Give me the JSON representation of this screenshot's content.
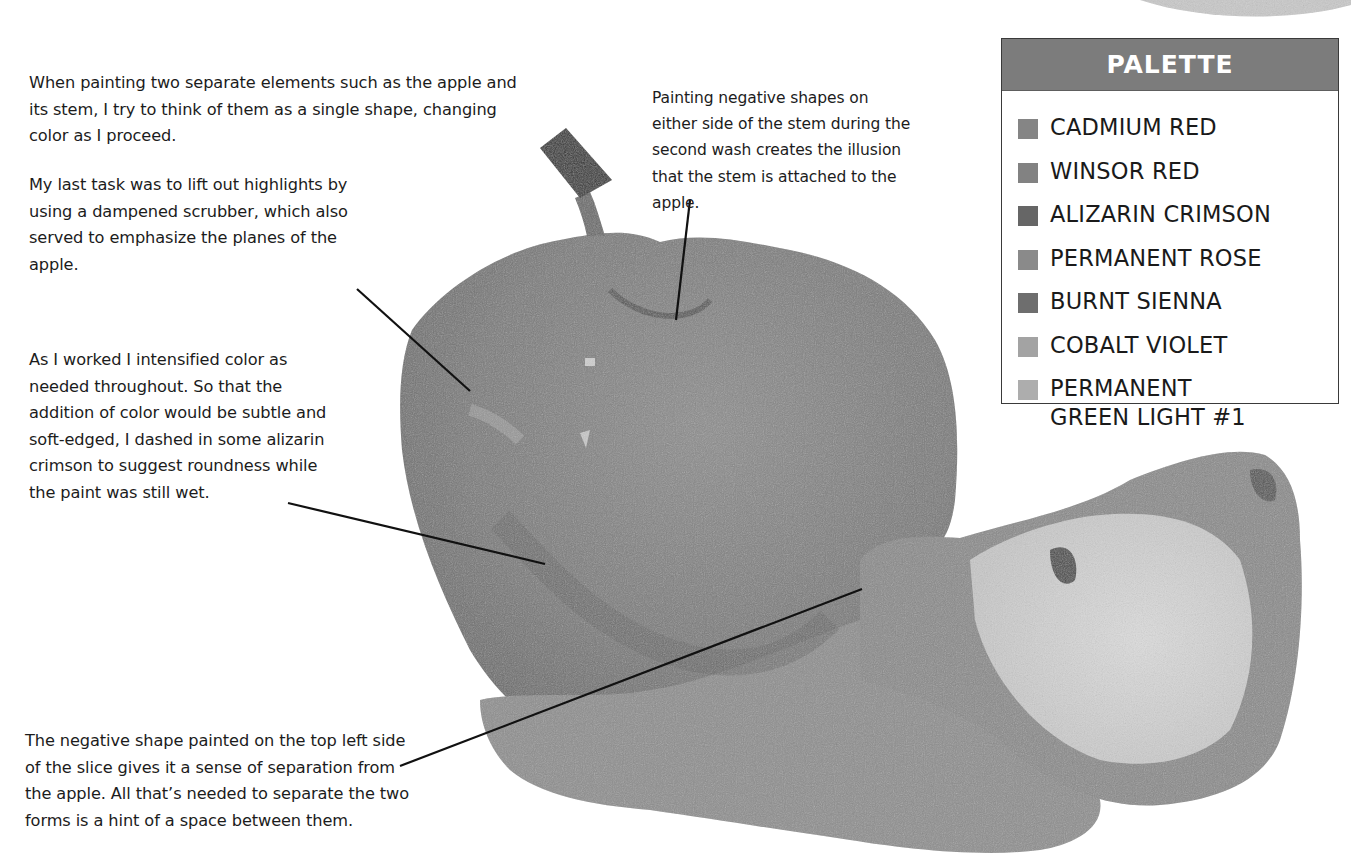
{
  "captions": {
    "stem_single_shape": "When painting two separate elements such as the apple and its stem, I try to think of them as a single shape, changing color as I proceed.",
    "lift_highlights": "My last task was to lift out highlights by using a dampened scrubber, which also served to emphasize the planes of the apple.",
    "intensify_color": "As I worked I intensified color as needed throughout. So that the addition of color would be subtle and soft-edged, I dashed in some alizarin crimson to suggest roundness while the paint was still wet.",
    "negative_shapes_stem": "Painting negative shapes on either side of the stem during the second wash creates the illusion that the stem is attached to the apple.",
    "slice_separation": "The negative shape painted on the top left side of the slice gives it a sense of separation from the apple. All that’s needed to separate the two forms is a hint of a space between them."
  },
  "palette": {
    "title": "PALETTE",
    "header_color": "#7c7c7c",
    "items": [
      {
        "label": "CADMIUM RED",
        "color": "#858585"
      },
      {
        "label": "WINSOR RED",
        "color": "#828282"
      },
      {
        "label": "ALIZARIN CRIMSON",
        "color": "#666666"
      },
      {
        "label": "PERMANENT ROSE",
        "color": "#8a8a8a"
      },
      {
        "label": "BURNT SIENNA",
        "color": "#6e6e6e"
      },
      {
        "label": "COBALT VIOLET",
        "color": "#a3a3a3"
      },
      {
        "label": "PERMANENT",
        "label_line2": "GREEN LIGHT #1",
        "color": "#adadad"
      }
    ]
  },
  "illustration": {
    "subject": "watercolor apple with stem and apple slice",
    "apple_color": "#7a7a7a",
    "slice_flesh_color": "#d6d6d6"
  }
}
